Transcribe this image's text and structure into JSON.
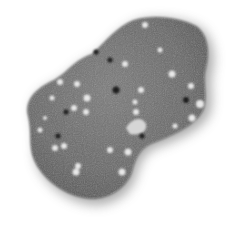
{
  "image": {
    "subject": "speckled grey rock",
    "background_color": "#ffffff",
    "rock_color": "#6b6b6b",
    "speckle_light_color": "#e6e6e6",
    "speckle_dark_color": "#1e1e1e"
  }
}
